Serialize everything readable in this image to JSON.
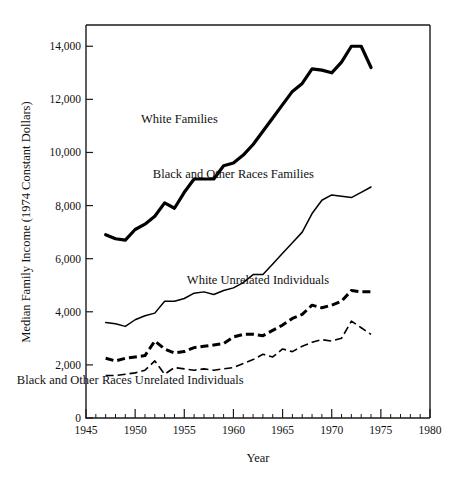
{
  "chart_data": {
    "type": "line",
    "title": "",
    "xlabel": "Year",
    "ylabel": "Median Family Income (1974 Constant Dollars)",
    "xlim": [
      1945,
      1980
    ],
    "ylim": [
      0,
      14800
    ],
    "grid": false,
    "legend_position": "inline-annotations",
    "x_ticks": [
      1945,
      1950,
      1955,
      1960,
      1965,
      1970,
      1975,
      1980
    ],
    "x_tick_labels": [
      "1945",
      "1950",
      "1955",
      "1960",
      "1965",
      "1970",
      "1975",
      "1980"
    ],
    "x_minor_tick_step": 1,
    "y_ticks": [
      0,
      2000,
      4000,
      6000,
      8000,
      10000,
      12000,
      14000
    ],
    "y_tick_labels": [
      "0",
      "2,000",
      "4,000",
      "6,000",
      "8,000",
      "10,000",
      "12,000",
      "14,000"
    ],
    "x": [
      1947,
      1948,
      1949,
      1950,
      1951,
      1952,
      1953,
      1954,
      1955,
      1956,
      1957,
      1958,
      1959,
      1960,
      1961,
      1962,
      1963,
      1964,
      1965,
      1966,
      1967,
      1968,
      1969,
      1970,
      1971,
      1972,
      1973,
      1974
    ],
    "series": [
      {
        "name": "White Families",
        "style": "solid-thick",
        "values": [
          6900,
          6750,
          6700,
          7100,
          7300,
          7600,
          8100,
          7900,
          8500,
          9000,
          9000,
          9000,
          9500,
          9600,
          9900,
          10300,
          10800,
          11300,
          11800,
          12300,
          12600,
          13150,
          13100,
          13000,
          13400,
          14000,
          14000,
          13200
        ]
      },
      {
        "name": "Black and Other Races Families",
        "style": "solid-thin",
        "values": [
          3600,
          3550,
          3450,
          3700,
          3850,
          3950,
          4400,
          4400,
          4500,
          4700,
          4750,
          4650,
          4800,
          4900,
          5100,
          5400,
          5400,
          5800,
          6200,
          6600,
          7000,
          7700,
          8200,
          8400,
          8350,
          8300,
          8500,
          8700
        ]
      },
      {
        "name": "White Unrelated Individuals",
        "style": "dashed-thick",
        "values": [
          2250,
          2150,
          2250,
          2300,
          2350,
          2900,
          2600,
          2450,
          2500,
          2650,
          2700,
          2750,
          2800,
          3050,
          3150,
          3150,
          3100,
          3300,
          3500,
          3750,
          3900,
          4250,
          4150,
          4250,
          4400,
          4800,
          4750,
          4750
        ]
      },
      {
        "name": "Black and Other Races Unrelated Individuals",
        "style": "dashed-thin",
        "values": [
          1600,
          1600,
          1650,
          1700,
          1800,
          2150,
          1650,
          1900,
          1850,
          1800,
          1850,
          1800,
          1850,
          1900,
          2050,
          2200,
          2400,
          2300,
          2600,
          2500,
          2700,
          2850,
          2950,
          2900,
          3000,
          3650,
          3400,
          3150
        ]
      }
    ],
    "annotations": [
      {
        "text": "White Families",
        "x": 1954.5,
        "y": 11100
      },
      {
        "text": "Black and Other Races Families",
        "x": 1960.0,
        "y": 9050
      },
      {
        "text": "White Unrelated Individuals",
        "x": 1962.5,
        "y": 5050
      },
      {
        "text": "Black and Other Races Unrelated Individuals",
        "x": 1949.5,
        "y": 1300
      }
    ]
  },
  "labels": {
    "y_axis_title": "Median Family Income (1974 Constant Dollars)",
    "x_axis_title": "Year",
    "series_white_families": "White Families",
    "series_black_families": "Black and Other Races Families",
    "series_white_individuals": "White Unrelated Individuals",
    "series_black_individuals": "Black and Other Races Unrelated Individuals",
    "y_0": "0",
    "y_2000": "2,000",
    "y_4000": "4,000",
    "y_6000": "6,000",
    "y_8000": "8,000",
    "y_10000": "10,000",
    "y_12000": "12,000",
    "y_14000": "14,000",
    "x_1945": "1945",
    "x_1950": "1950",
    "x_1955": "1955",
    "x_1960": "1960",
    "x_1965": "1965",
    "x_1970": "1970",
    "x_1975": "1975",
    "x_1980": "1980"
  },
  "colors": {
    "ink": "#111111",
    "line": "#000000",
    "background": "#ffffff"
  }
}
